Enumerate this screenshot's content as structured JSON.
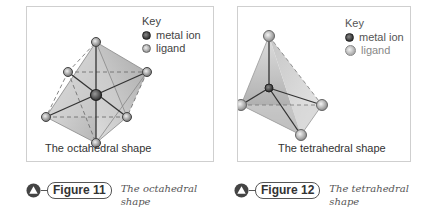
{
  "figures": [
    {
      "shape_label": "The octahedral shape",
      "key": {
        "title": "Key",
        "metal_ion": "metal ion",
        "ligand": "ligand"
      },
      "badge": "Figure 11",
      "caption": "The octahedral shape"
    },
    {
      "shape_label": "The tetrahedral shape",
      "key": {
        "title": "Key",
        "metal_ion": "metal ion",
        "ligand": "ligand"
      },
      "badge": "Figure 12",
      "caption": "The tetrahedral shape"
    }
  ],
  "colors": {
    "panel_border": "#cfcfcf",
    "metal_ion": "#333333",
    "ligand": "#999999",
    "badge_icon": "#444444"
  }
}
